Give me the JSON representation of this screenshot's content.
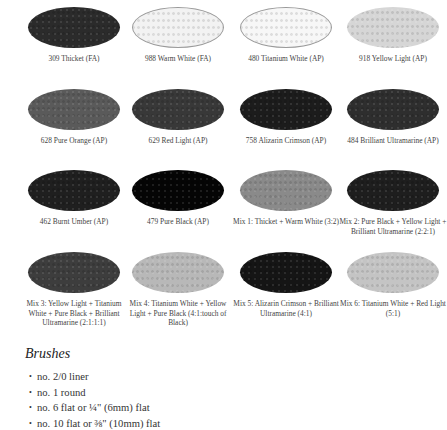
{
  "swatches": [
    {
      "label": "309 Thicket (FA)",
      "color": "#2b2b2b",
      "outlined": false
    },
    {
      "label": "988 Warm White (FA)",
      "color": "#f2f2f2",
      "outlined": true
    },
    {
      "label": "480 Titanium White (AP)",
      "color": "#f7f7f7",
      "outlined": true
    },
    {
      "label": "918 Yellow Light (AP)",
      "color": "#d6d6d6",
      "outlined": false
    },
    {
      "label": "628 Pure Orange (AP)",
      "color": "#5a5a5a",
      "outlined": false
    },
    {
      "label": "629 Red Light (AP)",
      "color": "#383838",
      "outlined": false
    },
    {
      "label": "758 Alizarin Crimson (AP)",
      "color": "#1c1c1c",
      "outlined": false
    },
    {
      "label": "484 Brilliant Ultramarine (AP)",
      "color": "#2e2e2e",
      "outlined": false
    },
    {
      "label": "462 Burnt Umber (AP)",
      "color": "#1f1f1f",
      "outlined": false
    },
    {
      "label": "479 Pure Black (AP)",
      "color": "#050505",
      "outlined": false
    },
    {
      "label": "Mix 1: Thicket + Warm White (3:2)",
      "color": "#8a8a8a",
      "outlined": false
    },
    {
      "label": "Mix 2: Pure Black + Yellow Light + Brilliant Ultramarine (2:2:1)",
      "color": "#1e1e1e",
      "outlined": false
    },
    {
      "label": "Mix 3: Yellow Light + Titanium White + Pure Black + Brilliant Ultramarine (2:1:1:1)",
      "color": "#3d3d3d",
      "outlined": false
    },
    {
      "label": "Mix 4: Titanium White + Yellow Light + Pure Black (4:1:touch of Black)",
      "color": "#b8b8b8",
      "outlined": false
    },
    {
      "label": "Mix 5: Alizarin Crimson + Brilliant Ultramarine (4:1)",
      "color": "#151515",
      "outlined": false
    },
    {
      "label": "Mix 6: Titanium White + Red Light (5:1)",
      "color": "#c4c4c4",
      "outlined": false
    }
  ],
  "brushes": {
    "heading": "Brushes",
    "bullet": "•",
    "items": [
      "no. 2/0 liner",
      "no. 1 round",
      "no. 6 flat or  ¼\" (6mm) flat",
      "no. 10 flat or ⅜\" (10mm) flat"
    ]
  }
}
